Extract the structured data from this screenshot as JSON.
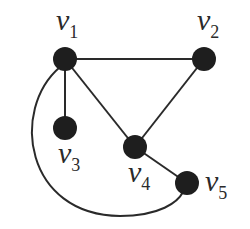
{
  "graph": {
    "nodes": [
      {
        "id": "v1",
        "letter": "v",
        "sub": "1",
        "x": 65,
        "y": 59,
        "lx": 56,
        "ly": 30
      },
      {
        "id": "v2",
        "letter": "v",
        "sub": "2",
        "x": 204,
        "y": 59,
        "lx": 197,
        "ly": 30
      },
      {
        "id": "v3",
        "letter": "v",
        "sub": "3",
        "x": 65,
        "y": 128,
        "lx": 58,
        "ly": 163
      },
      {
        "id": "v4",
        "letter": "v",
        "sub": "4",
        "x": 135,
        "y": 147,
        "lx": 128,
        "ly": 182
      },
      {
        "id": "v5",
        "letter": "v",
        "sub": "5",
        "x": 187,
        "y": 183,
        "lx": 205,
        "ly": 191
      }
    ],
    "edges": [
      {
        "from": "v1",
        "to": "v2"
      },
      {
        "from": "v1",
        "to": "v3"
      },
      {
        "from": "v1",
        "to": "v4"
      },
      {
        "from": "v2",
        "to": "v4"
      },
      {
        "from": "v4",
        "to": "v5"
      },
      {
        "from": "v1",
        "to": "v5",
        "curved": true
      }
    ],
    "node_color": "#1e1e1e",
    "edge_color": "#2a2a2a"
  }
}
